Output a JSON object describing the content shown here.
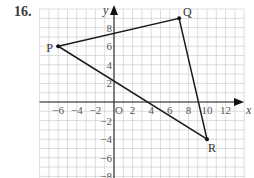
{
  "question_number": "16.",
  "axes": {
    "x_label": "x",
    "y_label": "y",
    "origin_label": "O",
    "x_ticks": [
      -6,
      -4,
      -2,
      2,
      4,
      6,
      8,
      10,
      12
    ],
    "y_ticks": [
      8,
      6,
      4,
      2,
      -2,
      -4,
      -6,
      -8
    ],
    "x_range": [
      -8,
      14
    ],
    "y_range": [
      -8,
      10
    ]
  },
  "points": [
    {
      "label": "P",
      "x": -6,
      "y": 6
    },
    {
      "label": "Q",
      "x": 7,
      "y": 9
    },
    {
      "label": "R",
      "x": 10,
      "y": -4
    }
  ],
  "triangle": [
    "P",
    "Q",
    "R"
  ],
  "colors": {
    "line": "#1a1a1a",
    "grid": "#cfcfcf",
    "text": "#555555"
  }
}
